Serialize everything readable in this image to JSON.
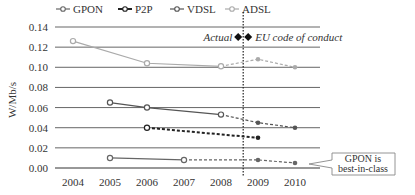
{
  "chart_data": {
    "type": "line",
    "title": "",
    "xlabel": "",
    "ylabel": "W/Mb/s",
    "ylim": [
      0,
      0.14
    ],
    "yticks": [
      "0.00",
      "0.02",
      "0.04",
      "0.06",
      "0.08",
      "0.10",
      "0.12",
      "0.14"
    ],
    "categories": [
      "2004",
      "2005",
      "2006",
      "2007",
      "2008",
      "2009",
      "2010"
    ],
    "grid": true,
    "legend_position": "top",
    "series": [
      {
        "name": "GPON",
        "color": "#666666",
        "width": 1.2,
        "actual": [
          [
            2005,
            0.01
          ],
          [
            2007,
            0.008
          ]
        ],
        "projected": [
          [
            2007,
            0.008
          ],
          [
            2009,
            0.008
          ],
          [
            2010,
            0.005
          ]
        ]
      },
      {
        "name": "P2P",
        "color": "#222222",
        "width": 2,
        "actual": [
          [
            2006,
            0.04
          ]
        ],
        "projected": [
          [
            2006,
            0.04
          ],
          [
            2009,
            0.03
          ]
        ]
      },
      {
        "name": "VDSL",
        "color": "#555555",
        "width": 1.2,
        "actual": [
          [
            2005,
            0.065
          ],
          [
            2006,
            0.06
          ],
          [
            2008,
            0.053
          ]
        ],
        "projected": [
          [
            2008,
            0.053
          ],
          [
            2009,
            0.045
          ],
          [
            2010,
            0.04
          ]
        ]
      },
      {
        "name": "ADSL",
        "color": "#aaaaaa",
        "width": 1.2,
        "actual": [
          [
            2004,
            0.126
          ],
          [
            2006,
            0.104
          ],
          [
            2008,
            0.101
          ]
        ],
        "projected": [
          [
            2008,
            0.101
          ],
          [
            2009,
            0.108
          ],
          [
            2010,
            0.1
          ]
        ]
      }
    ],
    "annotations": {
      "actual_label": "Actual",
      "projection_label": "EU code of conduct",
      "divider_x": 2008.6,
      "callout": [
        "GPON is",
        "best-in-class"
      ]
    }
  }
}
